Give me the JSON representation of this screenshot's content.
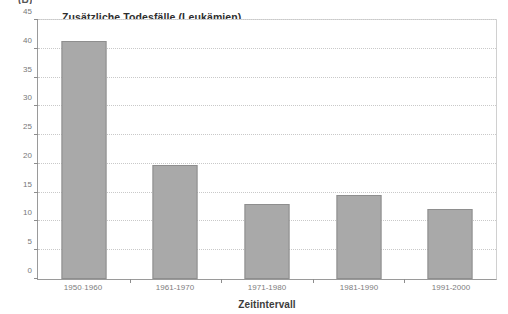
{
  "panel": {
    "letter": "(B)"
  },
  "axis": {
    "x_title": "Zeitintervall"
  },
  "chart_data": {
    "type": "bar",
    "title": "Zusätzliche Todesfälle (Leukämien)",
    "xlabel": "Zeitintervall",
    "ylabel": "",
    "categories": [
      "1950-1960",
      "1961-1970",
      "1971-1980",
      "1981-1990",
      "1991-2000"
    ],
    "values": [
      41.4,
      19.8,
      13.1,
      14.6,
      12.2
    ],
    "ylim": [
      0,
      45
    ],
    "yticks": [
      0,
      5,
      10,
      15,
      20,
      25,
      30,
      35,
      40,
      45
    ],
    "ytick_labels": [
      "0",
      "5",
      "10",
      "15",
      "20",
      "25",
      "30",
      "35",
      "40",
      "45"
    ],
    "grid": true,
    "legend": false,
    "bar_color": "#a9a9a9",
    "bar_edge_color": "#8e8e8e",
    "grid_color": "#c9c9c9",
    "axis_color": "#8d8d8d",
    "background": "#ffffff"
  }
}
